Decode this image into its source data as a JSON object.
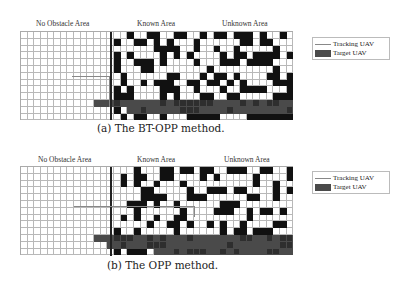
{
  "panels": [
    {
      "id": "a",
      "caption": "(a) The BT-OPP method.",
      "area_labels": {
        "no_obstacle": "No Obstacle Area",
        "known": "Known Area",
        "unknown": "Unknown Area"
      },
      "legend": {
        "tracking": "Tracking UAV",
        "target": "Target UAV"
      }
    },
    {
      "id": "b",
      "caption": "(b) The OPP method.",
      "area_labels": {
        "no_obstacle": "No Obstacle Area",
        "known": "Known Area",
        "unknown": "Unknown Area"
      },
      "legend": {
        "tracking": "Tracking UAV",
        "target": "Target UAV"
      }
    }
  ],
  "grid": {
    "cols": 41,
    "rows": 13,
    "known_start_col": 14
  },
  "colors": {
    "obstacle": "#111111",
    "target": "#4a4a4a",
    "tracking": "#888888",
    "grid_line": "#b8b8b8"
  }
}
